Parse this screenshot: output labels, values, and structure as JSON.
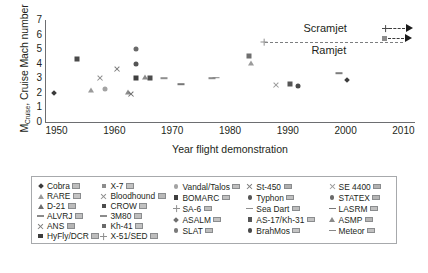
{
  "chart_data": {
    "type": "scatter",
    "title": "",
    "xlabel": "Year flight demonstration",
    "ylabel": "M",
    "ylabel_sub": "Cruise",
    "ylabel_rest": ", Cruise Mach number",
    "xlim": [
      1948,
      2012
    ],
    "ylim": [
      0,
      7
    ],
    "xticks": [
      1950,
      1960,
      1970,
      1980,
      1990,
      2000,
      2010
    ],
    "yticks": [
      0,
      1,
      2,
      3,
      4,
      5,
      6,
      7
    ],
    "grid": false,
    "legend_position": "below-plot",
    "annotations": [
      {
        "text": "Scramjet",
        "x": 2001,
        "y": 6.35
      },
      {
        "text": "Ramjet",
        "x": 2001,
        "y": 4.85
      }
    ],
    "reference_line": {
      "label": "Ramjet/Scramjet boundary",
      "y": 5.5,
      "x_start": 1986,
      "x_end": 2010,
      "style": "dashed"
    },
    "points": [
      {
        "name": "Cobra",
        "year": 1949.5,
        "mach": 2.0,
        "marker": "diamond",
        "color": "#3a3a3a"
      },
      {
        "name": "X-7",
        "year": 1953.5,
        "mach": 4.3,
        "marker": "square",
        "color": "#4a4a4a"
      },
      {
        "name": "RARE",
        "year": 1956.0,
        "mach": 2.2,
        "marker": "triangle",
        "color": "#9a9a9a"
      },
      {
        "name": "Bloodhound",
        "year": 1957.5,
        "mach": 3.05,
        "marker": "x",
        "color": "#8d8d8d"
      },
      {
        "name": "Vandal/Talos",
        "year": 1958.3,
        "mach": 2.25,
        "marker": "circle",
        "color": "#a3a3a3"
      },
      {
        "name": "SE 4400",
        "year": 1960.5,
        "mach": 3.65,
        "marker": "x",
        "color": "#7b7b7b"
      },
      {
        "name": "D-21",
        "year": 1962.3,
        "mach": 2.05,
        "marker": "triangle",
        "color": "#8b8b8b"
      },
      {
        "name": "ANS",
        "year": 1962.9,
        "mach": 1.95,
        "marker": "x",
        "color": "#6f6f6f"
      },
      {
        "name": "STATEX",
        "year": 1963.8,
        "mach": 5.0,
        "marker": "circle",
        "color": "#6a6a6a"
      },
      {
        "name": "Typhon",
        "year": 1963.8,
        "mach": 4.0,
        "marker": "circle",
        "color": "#555555"
      },
      {
        "name": "BOMARC",
        "year": 1963.7,
        "mach": 3.05,
        "marker": "square",
        "color": "#3f3f3f"
      },
      {
        "name": "ASMP",
        "year": 1965.3,
        "mach": 3.1,
        "marker": "triangle",
        "color": "#8a8a8a"
      },
      {
        "name": "CROW",
        "year": 1966.2,
        "mach": 3.05,
        "marker": "square",
        "color": "#4d4d4d"
      },
      {
        "name": "Sea Dart",
        "year": 1968.6,
        "mach": 3.0,
        "marker": "dash",
        "color": "#8f8f8f"
      },
      {
        "name": "LASRM",
        "year": 1971.5,
        "mach": 2.6,
        "marker": "dash",
        "color": "#777777"
      },
      {
        "name": "3M80",
        "year": 1976.8,
        "mach": 3.0,
        "marker": "dash",
        "color": "#8b8b8b"
      },
      {
        "name": "Meteor",
        "year": 1977.6,
        "mach": 3.05,
        "marker": "dash",
        "color": "#888888"
      },
      {
        "name": "SA-6",
        "year": 1985.9,
        "mach": 5.5,
        "marker": "plus",
        "color": "#909090"
      },
      {
        "name": "ASALM",
        "year": 1983.2,
        "mach": 4.5,
        "marker": "square",
        "color": "#6f6f6f"
      },
      {
        "name": "SLAT",
        "year": 1983.6,
        "mach": 4.05,
        "marker": "triangle",
        "color": "#9b9b9b"
      },
      {
        "name": "Kh-41",
        "year": 1988.0,
        "mach": 2.55,
        "marker": "x",
        "color": "#9a9a9a"
      },
      {
        "name": "AS-17/Kh-31",
        "year": 1990.3,
        "mach": 2.6,
        "marker": "square",
        "color": "#565656"
      },
      {
        "name": "BrahMos",
        "year": 1991.8,
        "mach": 2.45,
        "marker": "circle",
        "color": "#4a4a4a"
      },
      {
        "name": "St-450",
        "year": 1998.8,
        "mach": 3.35,
        "marker": "dash",
        "color": "#7d7d7d"
      },
      {
        "name": "HyFly/DCR",
        "year": 2000.2,
        "mach": 2.85,
        "marker": "diamond",
        "color": "#3d3d3d"
      }
    ]
  },
  "legend": {
    "columns": [
      {
        "items": [
          {
            "label": "Cobra",
            "marker": "diamond",
            "color": "#3a3a3a",
            "flag": "#bdbdbd"
          },
          {
            "label": "RARE",
            "marker": "triangle",
            "color": "#9a9a9a",
            "flag": "#c4c4c4"
          },
          {
            "label": "D-21",
            "marker": "triangle",
            "color": "#6e6e6e",
            "flag": "#bcbcbc"
          },
          {
            "label": "ALVRJ",
            "marker": "dash",
            "color": "#8a8a8a",
            "flag": "#c0c0c0"
          },
          {
            "label": "ANS",
            "marker": "x",
            "color": "#7e7e7e",
            "flag": "#b5b5b5"
          },
          {
            "label": "HyFly/DCR",
            "marker": "square",
            "color": "#3d3d3d",
            "flag": "#bdbdbd"
          }
        ]
      },
      {
        "items": [
          {
            "label": "X-7",
            "marker": "square",
            "color": "#8d8d8d",
            "flag": "#c2c2c2"
          },
          {
            "label": "Bloodhound",
            "marker": "x",
            "color": "#8d8d8d",
            "flag": "#b9b9b9"
          },
          {
            "label": "CROW",
            "marker": "square",
            "color": "#4d4d4d",
            "flag": "#c1c1c1"
          },
          {
            "label": "3M80",
            "marker": "dash",
            "color": "#8b8b8b",
            "flag": "#bfbfbf"
          },
          {
            "label": "Kh-41",
            "marker": "square",
            "color": "#6a6a6a",
            "flag": "#c3c3c3"
          },
          {
            "label": "X-51/SED",
            "marker": "plus",
            "color": "#8f8f8f",
            "flag": "#bdbdbd"
          }
        ]
      },
      {
        "items": [
          {
            "label": "Vandal/Talos",
            "marker": "circle",
            "color": "#a3a3a3",
            "flag": "#bfbfbf"
          },
          {
            "label": "BOMARC",
            "marker": "square",
            "color": "#3f3f3f",
            "flag": "#c0c0c0"
          },
          {
            "label": "SA-6",
            "marker": "plus",
            "color": "#909090",
            "flag": "#bdbdbd"
          },
          {
            "label": "ASALM",
            "marker": "diamond",
            "color": "#6f6f6f",
            "flag": "#c2c2c2"
          },
          {
            "label": "SLAT",
            "marker": "circle",
            "color": "#7a7a7a",
            "flag": "#bebebe"
          }
        ]
      },
      {
        "items": [
          {
            "label": "St-450",
            "marker": "x",
            "color": "#7d7d7d",
            "flag": "#b0b0b0"
          },
          {
            "label": "Typhon",
            "marker": "circle",
            "color": "#555555",
            "flag": "#c0c0c0"
          },
          {
            "label": "Sea Dart",
            "marker": "dash",
            "color": "#8f8f8f",
            "flag": "#bdbdbd"
          },
          {
            "label": "AS-17/Kh-31",
            "marker": "square",
            "color": "#565656",
            "flag": "#c3c3c3"
          },
          {
            "label": "BrahMos",
            "marker": "circle",
            "color": "#4a4a4a",
            "flag": "#c4c4c4"
          }
        ]
      },
      {
        "items": [
          {
            "label": "SE 4400",
            "marker": "x",
            "color": "#9b9b9b",
            "flag": "#b2b2b2"
          },
          {
            "label": "STATEX",
            "marker": "circle",
            "color": "#6a6a6a",
            "flag": "#b4b4b4"
          },
          {
            "label": "LASRM",
            "marker": "dash",
            "color": "#777777",
            "flag": "#c0c0c0"
          },
          {
            "label": "ASMP",
            "marker": "triangle",
            "color": "#8a8a8a",
            "flag": "#b6b6b6"
          },
          {
            "label": "Meteor",
            "marker": "dash",
            "color": "#888888",
            "flag": "#c1c1c1"
          }
        ]
      }
    ]
  }
}
